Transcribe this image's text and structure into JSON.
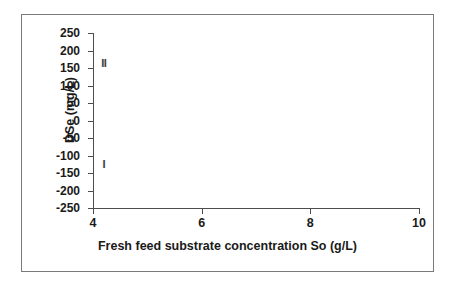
{
  "chart_data": {
    "type": "scatter",
    "title": "",
    "xlabel": "Fresh feed substrate concentration So (g/L)",
    "ylabel": "DSe  (mg/L)",
    "xlim": [
      4,
      10
    ],
    "ylim": [
      -250,
      250
    ],
    "grid": false,
    "legend": "none",
    "x_ticks": [
      {
        "value": 4,
        "label": "4"
      },
      {
        "value": 6,
        "label": "6"
      },
      {
        "value": 8,
        "label": "8"
      },
      {
        "value": 10,
        "label": "10"
      }
    ],
    "y_ticks": [
      {
        "value": 250,
        "label": "250"
      },
      {
        "value": 200,
        "label": "200"
      },
      {
        "value": 150,
        "label": "150"
      },
      {
        "value": 100,
        "label": "100"
      },
      {
        "value": 50,
        "label": "50"
      },
      {
        "value": 0,
        "label": "0"
      },
      {
        "value": -50,
        "label": "-50"
      },
      {
        "value": -100,
        "label": "-100"
      },
      {
        "value": -150,
        "label": "-150"
      },
      {
        "value": -200,
        "label": "-200"
      },
      {
        "value": -250,
        "label": "-250"
      }
    ],
    "points": [
      {
        "label": "II",
        "x": 4.2,
        "y": 165
      },
      {
        "label": "I",
        "x": 4.2,
        "y": -125
      }
    ],
    "axis_color": "#4d4d4d",
    "frame_color": "#7a7a7a",
    "background": "#ffffff"
  }
}
